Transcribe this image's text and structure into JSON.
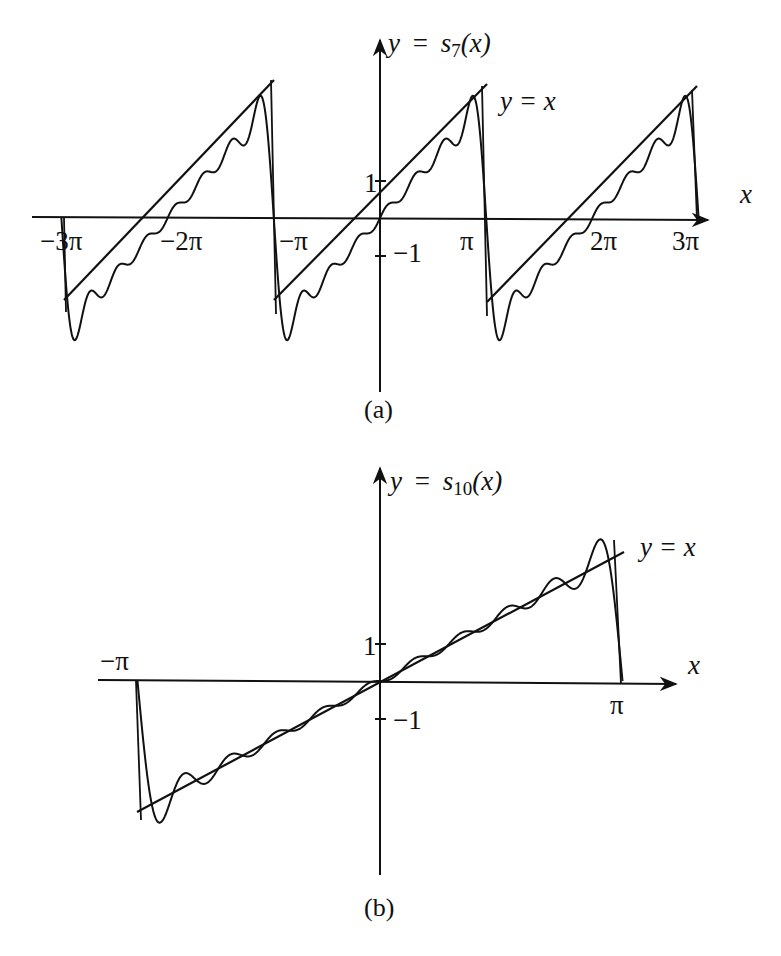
{
  "chart_data": [
    {
      "type": "line",
      "panel": "(a)",
      "title": "y = s7(x)",
      "curve_label": "y = s7(x)",
      "reference_label": "y = x",
      "xlabel": "x",
      "ylabel": "y",
      "x_ticks": [
        "-3π",
        "-2π",
        "-π",
        "π",
        "2π",
        "3π"
      ],
      "x_tick_values": [
        -9.4248,
        -6.2832,
        -3.1416,
        3.1416,
        6.2832,
        9.4248
      ],
      "y_ticks": [
        "1",
        "-1"
      ],
      "y_tick_values": [
        1,
        -1
      ],
      "xlim": [
        -9.4248,
        9.4248
      ],
      "ylim": [
        -3.6,
        3.6
      ],
      "n_terms": 7,
      "series": [
        {
          "name": "s7(x) (Fourier partial sum of sawtooth, periodic 2π)",
          "x": [
            -9.4248,
            -6.2832,
            -3.1416,
            0,
            3.1416,
            6.2832,
            9.4248
          ],
          "values": [
            0,
            0,
            0,
            0,
            0,
            0,
            0
          ]
        },
        {
          "name": "y = x (sawtooth, periodic extension)",
          "x": [
            -9.4248,
            -6.2832,
            -3.1416,
            0,
            3.1416,
            6.2832,
            9.4248
          ],
          "values": [
            -3.1416,
            0,
            3.1416,
            0,
            3.1416,
            0,
            3.1416
          ]
        }
      ],
      "grid": false,
      "caption": "(a)"
    },
    {
      "type": "line",
      "panel": "(b)",
      "title": "y = s10(x)",
      "curve_label": "y = s10(x)",
      "reference_label": "y = x",
      "xlabel": "x",
      "ylabel": "y",
      "x_ticks": [
        "-π",
        "π"
      ],
      "x_tick_values": [
        -3.1416,
        3.1416
      ],
      "y_ticks": [
        "1",
        "-1"
      ],
      "y_tick_values": [
        1,
        -1
      ],
      "xlim": [
        -3.1416,
        3.1416
      ],
      "ylim": [
        -3.6,
        3.6
      ],
      "n_terms": 10,
      "series": [
        {
          "name": "s10(x)",
          "x": [
            -3.1416,
            -2.9,
            0,
            2.9,
            3.1416
          ],
          "values": [
            0,
            -3.3,
            0,
            3.3,
            0
          ]
        },
        {
          "name": "y = x",
          "x": [
            -3.1416,
            3.1416
          ],
          "values": [
            -3.1416,
            3.1416
          ]
        }
      ],
      "grid": false,
      "caption": "(b)"
    }
  ],
  "panel_a": {
    "curve_label_y": "y",
    "curve_label_eq": "=",
    "curve_label_s": "s",
    "curve_label_sub": "7",
    "curve_label_arg": "(x)",
    "ref_label": "y = x",
    "x_axis_label": "x",
    "ticks": {
      "m3pi": "−3π",
      "m2pi": "−2π",
      "mpi": "−π",
      "pi": "π",
      "p2pi": "2π",
      "p3pi": "3π",
      "one": "1",
      "minus_one": "−1"
    },
    "caption": "(a)"
  },
  "panel_b": {
    "curve_label_y": "y",
    "curve_label_eq": "=",
    "curve_label_s": "s",
    "curve_label_sub": "10",
    "curve_label_arg": "(x)",
    "ref_label": "y = x",
    "x_axis_label": "x",
    "ticks": {
      "mpi": "−π",
      "pi": "π",
      "one": "1",
      "minus_one": "−1"
    },
    "caption": "(b)"
  },
  "colors": {
    "ink": "#111111",
    "background": "#ffffff"
  }
}
